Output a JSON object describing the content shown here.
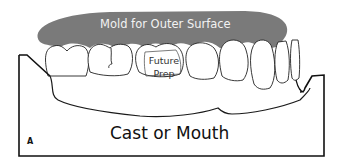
{
  "diagram": {
    "labels": {
      "mold": "Mold for Outer Surface",
      "future_prep_line1": "Future",
      "future_prep_line2": "Prep",
      "cast": "Cast or Mouth",
      "panel": "A"
    },
    "colors": {
      "mold_fill": "#7a7a7a",
      "mold_text": "#f2f2f2",
      "outline": "#1a1a1a",
      "background": "#ffffff"
    }
  }
}
